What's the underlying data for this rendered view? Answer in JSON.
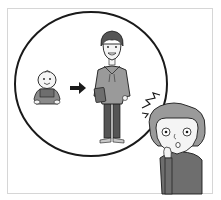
{
  "illustration": {
    "caption": "Elderly woman surprised at how a baby grew into an adult man",
    "scene": {
      "thought_bubble": {
        "shape": "circle",
        "contents": [
          "baby",
          "arrow",
          "young-man"
        ]
      },
      "baby": {
        "pose": "sitting",
        "expression": "smiling"
      },
      "arrow": {
        "direction": "right"
      },
      "young_man": {
        "clothing": "hoodie and trousers",
        "holding": "book",
        "expression": "smiling"
      },
      "elderly_woman": {
        "expression": "surprised",
        "gesture": "hand on mouth",
        "effect": "shock-lines"
      }
    },
    "colors": {
      "background": "#ffffff",
      "frame": "#d6d6d6",
      "outline": "#1a1a1a",
      "gray_dark": "#6e6e6e",
      "gray_mid": "#9a9a9a",
      "gray_light": "#c8c8c8",
      "skin": "#f4f4f4"
    }
  }
}
